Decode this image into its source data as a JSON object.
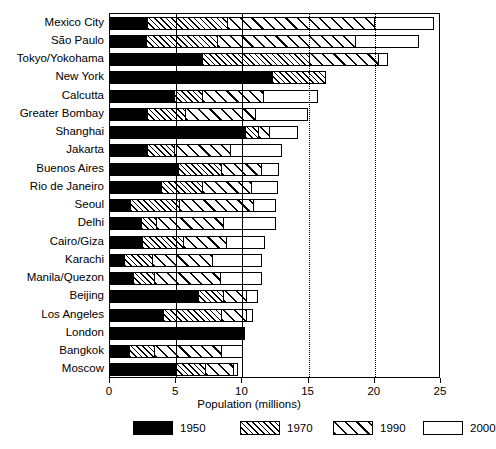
{
  "chart_data": {
    "type": "bar",
    "subtype": "stacked-horizontal",
    "title": "",
    "xlabel": "Population (millions)",
    "ylabel": "",
    "xlim": [
      0,
      25
    ],
    "xticks": [
      0,
      5,
      10,
      15,
      20,
      25
    ],
    "xtick_labels": [
      "0",
      "5",
      "10",
      "15",
      "20",
      "25"
    ],
    "grid": "vertical gridlines at 5, 10 (solid) and 15, 20 (dotted)",
    "legend_position": "bottom",
    "series": [
      {
        "name": "1950",
        "fill": "solid-black",
        "color": "#000000"
      },
      {
        "name": "1970",
        "fill": "fine-diagonal-hatch",
        "color": "#000000"
      },
      {
        "name": "1990",
        "fill": "coarse-diagonal-hatch",
        "color": "#000000"
      },
      {
        "name": "2000",
        "fill": "white-empty",
        "color": "#ffffff"
      }
    ],
    "categories": [
      "Mexico City",
      "São Paulo",
      "Tokyo/Yokohama",
      "New York",
      "Calcutta",
      "Greater Bombay",
      "Shanghai",
      "Jakarta",
      "Buenos Aires",
      "Rio de Janeiro",
      "Seoul",
      "Delhi",
      "Cairo/Giza",
      "Karachi",
      "Manila/Quezon",
      "Beijing",
      "Los Angeles",
      "London",
      "Bangkok",
      "Moscow"
    ],
    "cumulative_totals": {
      "note": "Each series value is the cumulative population (millions) at that year; bar segments are the differences.",
      "Mexico City": {
        "1950": 2.9,
        "1970": 9.0,
        "1990": 20.2,
        "2000": 24.7
      },
      "São Paulo": {
        "1950": 2.8,
        "1970": 8.2,
        "1990": 18.7,
        "2000": 23.6
      },
      "Tokyo/Yokohama": {
        "1950": 7.0,
        "1970": 15.2,
        "1990": 20.5,
        "2000": 21.2
      },
      "New York": {
        "1950": 12.3,
        "1970": 16.4,
        "1990": 16.4,
        "2000": 16.4
      },
      "Calcutta": {
        "1950": 4.9,
        "1970": 7.1,
        "1990": 11.8,
        "2000": 15.9
      },
      "Greater Bombay": {
        "1950": 2.9,
        "1970": 5.8,
        "1990": 11.2,
        "2000": 15.2
      },
      "Shanghai": {
        "1950": 10.3,
        "1970": 11.3,
        "1990": 12.2,
        "2000": 14.4
      },
      "Jakarta": {
        "1950": 2.9,
        "1970": 5.0,
        "1990": 9.3,
        "2000": 13.2
      },
      "Buenos Aires": {
        "1950": 5.2,
        "1970": 8.5,
        "1990": 11.6,
        "2000": 13.0
      },
      "Rio de Janeiro": {
        "1950": 3.9,
        "1970": 7.1,
        "1990": 10.9,
        "2000": 12.9
      },
      "Seoul": {
        "1950": 1.6,
        "1970": 5.4,
        "1990": 11.0,
        "2000": 12.8
      },
      "Delhi": {
        "1950": 2.4,
        "1970": 3.6,
        "1990": 8.8,
        "2000": 12.8
      },
      "Cairo/Giza": {
        "1950": 2.5,
        "1970": 5.7,
        "1990": 9.0,
        "2000": 11.9
      },
      "Karachi": {
        "1950": 1.1,
        "1970": 3.3,
        "1990": 7.9,
        "2000": 11.7
      },
      "Manila/Quezon": {
        "1950": 1.8,
        "1970": 3.5,
        "1990": 8.5,
        "2000": 11.7
      },
      "Beijing": {
        "1950": 6.7,
        "1970": 8.7,
        "1990": 10.5,
        "2000": 11.4
      },
      "Los Angeles": {
        "1950": 4.1,
        "1970": 8.5,
        "1990": 10.5,
        "2000": 11.0
      },
      "London": {
        "1950": 10.1,
        "1970": 10.3,
        "1990": 10.3,
        "2000": 10.3
      },
      "Bangkok": {
        "1950": 1.5,
        "1970": 3.5,
        "1990": 8.6,
        "2000": 10.3
      },
      "Moscow": {
        "1950": 5.0,
        "1970": 7.3,
        "1990": 9.5,
        "2000": 9.9
      }
    }
  },
  "legend": {
    "items": [
      {
        "label": "1950",
        "fill": "f1950"
      },
      {
        "label": "1970",
        "fill": "f1970"
      },
      {
        "label": "1990",
        "fill": "f1990"
      },
      {
        "label": "2000",
        "fill": "f2000"
      }
    ]
  }
}
